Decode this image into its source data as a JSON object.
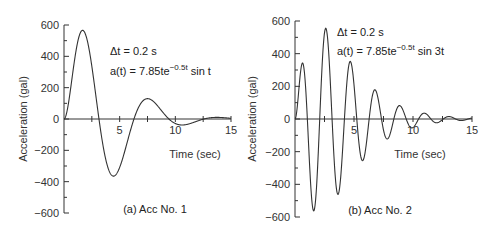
{
  "chart_data": [
    {
      "type": "line",
      "panel": "a",
      "caption": "(a) Acc No. 1",
      "formula": "a(t) = 7.85te^{-0.5t} sin t",
      "annotation": {
        "dt_label": "Δt = 0.2 s",
        "formula_prefix": "a(t) = 7.85te",
        "formula_exp": "−0.5t",
        "formula_suffix": " sin t"
      },
      "xlabel": "Time (sec)",
      "ylabel": "Acceleration (gal)",
      "xlim": [
        0,
        15
      ],
      "ylim": [
        -600,
        600
      ],
      "xticks": [
        5,
        10,
        15
      ],
      "yticks": [
        600,
        400,
        200,
        0,
        -200,
        -400,
        -600
      ],
      "ytick_labels": [
        "600",
        "400",
        "200",
        "0",
        "−200",
        "−400",
        "−600"
      ],
      "grid": false,
      "freq": 1,
      "amplitude": 785,
      "decay": 0.5,
      "x": [
        0,
        1,
        2,
        3,
        4,
        5,
        6,
        7,
        8,
        9,
        10,
        11,
        12,
        13,
        14,
        15
      ],
      "values": [
        0,
        400,
        520,
        100,
        -320,
        -310,
        -70,
        130,
        130,
        40,
        -29,
        -28,
        -10,
        5,
        8,
        4
      ],
      "peaks": [
        {
          "t": 1.8,
          "a": 570
        },
        {
          "t": 4.4,
          "a": -360
        },
        {
          "t": 7.6,
          "a": 135
        },
        {
          "t": 10.7,
          "a": -30
        },
        {
          "t": 13.8,
          "a": 10
        }
      ]
    },
    {
      "type": "line",
      "panel": "b",
      "caption": "(b) Acc No. 2",
      "formula": "a(t) = 7.85te^{-0.5t} sin 3t",
      "annotation": {
        "dt_label": "Δt = 0.2 s",
        "formula_prefix": "a(t) = 7.85te",
        "formula_exp": "−0.5t",
        "formula_suffix": " sin 3t"
      },
      "xlabel": "Time (sec)",
      "ylabel": "Acceleration (gal)",
      "xlim": [
        0,
        15
      ],
      "ylim": [
        -600,
        600
      ],
      "xticks": [
        5,
        10,
        15
      ],
      "yticks": [
        600,
        400,
        200,
        0,
        -200,
        -400,
        -600
      ],
      "ytick_labels": [
        "600",
        "400",
        "200",
        "0",
        "−200",
        "−400",
        "−600"
      ],
      "grid": false,
      "freq": 3,
      "amplitude": 785,
      "decay": 0.5,
      "peaks": [
        {
          "t": 0.55,
          "a": 330
        },
        {
          "t": 1.6,
          "a": -560
        },
        {
          "t": 2.65,
          "a": 550
        },
        {
          "t": 3.7,
          "a": -460
        },
        {
          "t": 4.7,
          "a": 350
        },
        {
          "t": 5.8,
          "a": -250
        },
        {
          "t": 6.85,
          "a": 180
        },
        {
          "t": 7.9,
          "a": -120
        },
        {
          "t": 8.95,
          "a": 85
        },
        {
          "t": 10.0,
          "a": -50
        },
        {
          "t": 11.05,
          "a": 40
        },
        {
          "t": 12.1,
          "a": -20
        },
        {
          "t": 13.2,
          "a": 15
        }
      ]
    }
  ]
}
